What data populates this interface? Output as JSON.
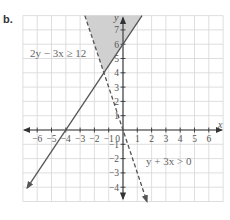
{
  "part_label": "b.",
  "chart_data": {
    "type": "line",
    "title": "",
    "xlabel": "x",
    "ylabel": "y",
    "xlim": [
      -7,
      7
    ],
    "ylim": [
      -5,
      8
    ],
    "grid": true,
    "x_ticks": [
      -6,
      -5,
      -4,
      -3,
      -2,
      -1,
      0,
      1,
      2,
      3,
      4,
      5,
      6
    ],
    "y_ticks": [
      -4,
      -3,
      -2,
      -1,
      1,
      2,
      3,
      4,
      5,
      6,
      7
    ],
    "origin_label": "0",
    "series": [
      {
        "name": "2y − 3x ≥ 12",
        "equation": "y = 1.5x + 6",
        "style": "solid",
        "points": [
          [
            -6.7,
            -4.05
          ],
          [
            1.33,
            8
          ]
        ]
      },
      {
        "name": "y + 3x > 0",
        "equation": "y = -3x",
        "style": "dashed",
        "points": [
          [
            -2.67,
            8
          ],
          [
            1.67,
            -5
          ]
        ]
      }
    ],
    "shaded_region": {
      "description": "solution region above both boundary lines",
      "vertices": [
        [
          -1.333,
          4
        ],
        [
          -2.667,
          8
        ],
        [
          1.333,
          8
        ]
      ],
      "color": "#d0d0d0"
    },
    "annotations": [
      {
        "text": "2y − 3x ≥ 12",
        "x": -5.6,
        "y": 5.1
      },
      {
        "text": "y + 3x > 0",
        "x": 1.5,
        "y": -1.75
      }
    ]
  },
  "labels": {
    "ineq1": "2y − 3x ≥ 12",
    "ineq2": "y + 3x > 0",
    "x_axis": "x",
    "y_axis": "y",
    "origin": "0"
  },
  "colors": {
    "grid": "#d6d6d6",
    "shade": "#d0d0d0",
    "line": "#555555",
    "axis": "#333333"
  }
}
